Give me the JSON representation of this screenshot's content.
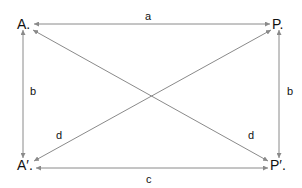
{
  "diagram": {
    "points": {
      "A": "A.",
      "P": "P.",
      "A_prime": "A′.",
      "P_prime": "P′."
    },
    "edges": {
      "top": "a",
      "left": "b",
      "right": "b",
      "bottom": "c",
      "diag_left": "d",
      "diag_right": "d"
    },
    "colors": {
      "line": "#8a8a8a",
      "text": "#111111",
      "background": "#ffffff"
    }
  }
}
